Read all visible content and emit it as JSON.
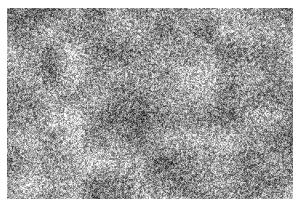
{
  "page": {
    "width": 300,
    "height": 206,
    "background_color": "#ffffff",
    "content_type": "grayscale-micrograph-texture",
    "alt_text": "Grayscale micrograph showing a fine-grained speckled microstructure"
  },
  "image": {
    "name": "grayscale-micrograph",
    "left": 7,
    "top": 8,
    "width": 286,
    "height": 191,
    "border": "none",
    "caption": "",
    "scale_bar": "",
    "labels": []
  },
  "texture": {
    "kind": "speckle-noise",
    "grain_size_px": 1.6,
    "mean_gray": 150,
    "contrast": 74,
    "min_gray": 20,
    "max_gray": 252,
    "mottle_scale_px": 22,
    "mottle_amplitude": 34,
    "large_scale_px": 70,
    "large_amplitude": 16,
    "seed": 20240617,
    "palette": {
      "darkest": "#141414",
      "dark": "#454545",
      "mid": "#969696",
      "light": "#cccccc",
      "lightest": "#fcfcfc",
      "page": "#ffffff"
    },
    "region_bias": [
      {
        "name": "top-left",
        "x": 0.18,
        "y": 0.18,
        "radius": 0.34,
        "delta": 6
      },
      {
        "name": "center",
        "x": 0.48,
        "y": 0.46,
        "radius": 0.3,
        "delta": -10
      },
      {
        "name": "bottom-left",
        "x": 0.18,
        "y": 0.8,
        "radius": 0.32,
        "delta": 14
      },
      {
        "name": "bottom-right",
        "x": 0.84,
        "y": 0.82,
        "radius": 0.3,
        "delta": -6
      },
      {
        "name": "top-right",
        "x": 0.85,
        "y": 0.2,
        "radius": 0.28,
        "delta": 4
      }
    ]
  }
}
